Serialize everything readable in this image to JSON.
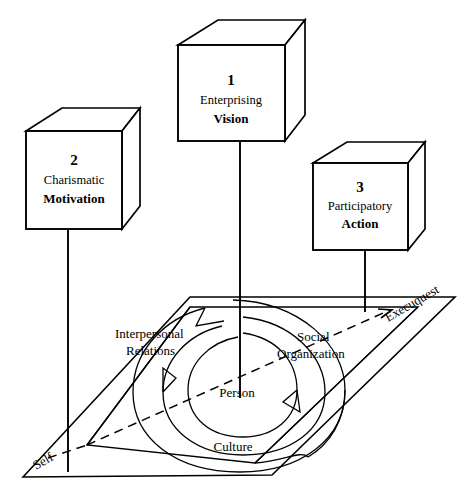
{
  "diagram": {
    "type": "3d-conceptual-diagram",
    "background_color": "#ffffff",
    "line_color": "#000000"
  },
  "cubes": [
    {
      "id": "cube-1",
      "number": "1",
      "line1": "Enterprising",
      "line2": "Vision",
      "connects_to": "Person"
    },
    {
      "id": "cube-2",
      "number": "2",
      "line1": "Charismatic",
      "line2": "Motivation",
      "connects_to": "Self"
    },
    {
      "id": "cube-3",
      "number": "3",
      "line1": "Participatory",
      "line2": "Action",
      "connects_to": "Execuquest"
    }
  ],
  "base": {
    "rings": [
      {
        "id": "ring-person",
        "label": "Person"
      },
      {
        "id": "ring-culture",
        "label": "Culture"
      },
      {
        "id": "ring-interpersonal",
        "label_line1": "Interpersonal",
        "label_line2": "Relations"
      },
      {
        "id": "ring-social",
        "label_line1": "Social",
        "label_line2": "Organization"
      }
    ],
    "corners": [
      {
        "id": "corner-self",
        "label": "Self"
      },
      {
        "id": "corner-execuquest",
        "label": "Execuquest"
      }
    ],
    "axis": {
      "id": "self-execuquest-axis",
      "style": "dashed"
    }
  }
}
